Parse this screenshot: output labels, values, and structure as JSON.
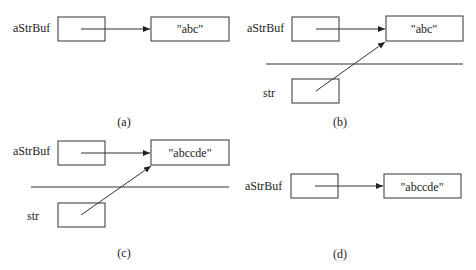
{
  "panels": [
    {
      "id": "a",
      "caption": "(a)",
      "var_label": "aStrBuf",
      "value": "\"abc\"",
      "has_str": false
    },
    {
      "id": "b",
      "caption": "(b)",
      "var_label": "aStrBuf",
      "value": "\"abc\"",
      "has_str": true,
      "str_label": "str"
    },
    {
      "id": "c",
      "caption": "(c)",
      "var_label": "aStrBuf",
      "value": "\"abccde\"",
      "has_str": true,
      "str_label": "str"
    },
    {
      "id": "d",
      "caption": "(d)",
      "var_label": "aStrBuf",
      "value": "\"abccde\"",
      "has_str": false
    }
  ]
}
